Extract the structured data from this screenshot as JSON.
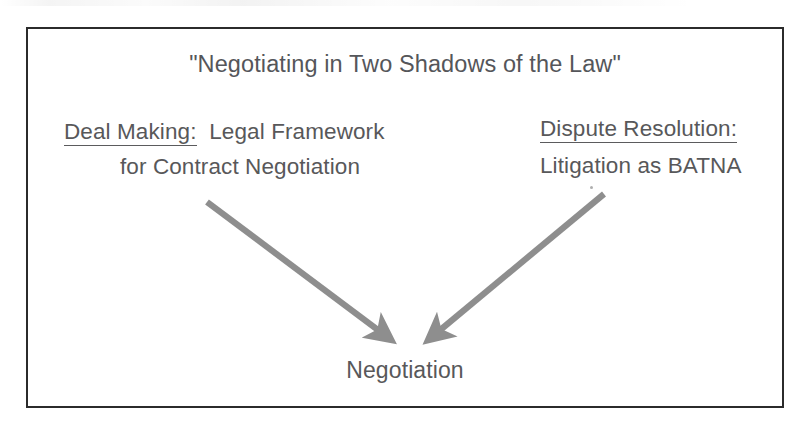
{
  "slide": {
    "title": "\"Negotiating in Two Shadows of the Law\"",
    "frame_color": "#2b2b2b",
    "background_color": "#ffffff",
    "text_color": "#58585a"
  },
  "left_branch": {
    "heading": "Deal Making",
    "heading_underlined": true,
    "colon": ":",
    "line1_rest": "Legal Framework",
    "line2": "for Contract Negotiation"
  },
  "right_branch": {
    "heading": "Dispute Resolution:",
    "heading_underlined": true,
    "line2": "Litigation as BATNA"
  },
  "convergence": {
    "label": "Negotiation"
  },
  "arrows": {
    "color": "#8e8e8e",
    "left": {
      "name": "deal-making-to-negotiation-arrow",
      "from_x": 207,
      "from_y": 202,
      "to_x": 392,
      "to_y": 341
    },
    "right": {
      "name": "dispute-resolution-to-negotiation-arrow",
      "from_x": 604,
      "from_y": 194,
      "to_x": 427,
      "to_y": 341
    }
  }
}
